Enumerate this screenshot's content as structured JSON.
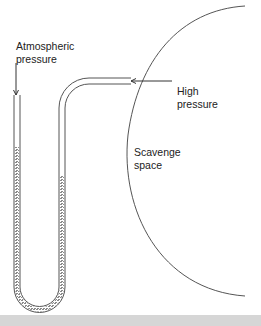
{
  "diagram": {
    "labels": {
      "atmospheric_line1": "Atmospheric",
      "atmospheric_line2": "pressure",
      "high_line1": "High",
      "high_line2": "pressure",
      "scavenge_line1": "Scavenge",
      "scavenge_line2": "space"
    },
    "colors": {
      "line": "#555555",
      "liquid": "#9a9a9a",
      "text": "#222222",
      "footer": "#d6d6d6"
    },
    "liquid_levels": {
      "open_leg_top_y": 147,
      "pressure_leg_top_y": 176
    }
  }
}
